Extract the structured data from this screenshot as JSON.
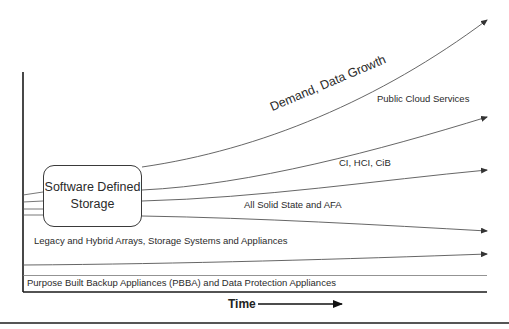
{
  "diagram": {
    "center_box": {
      "line1": "Software Defined",
      "line2": "Storage"
    },
    "trend_labels": {
      "demand": "Demand, Data Growth",
      "public_cloud": "Public Cloud Services",
      "ci_hci": "CI, HCI, CiB",
      "all_solid_state": "All Solid State and AFA",
      "legacy": "Legacy and Hybrid Arrays, Storage Systems and Appliances",
      "pbba": "Purpose Built Backup Appliances (PBBA) and Data Protection Appliances"
    },
    "x_axis_label": "Time",
    "colors": {
      "line": "#555555",
      "axis": "#1a1a1a",
      "text": "#2a2a2a"
    }
  }
}
